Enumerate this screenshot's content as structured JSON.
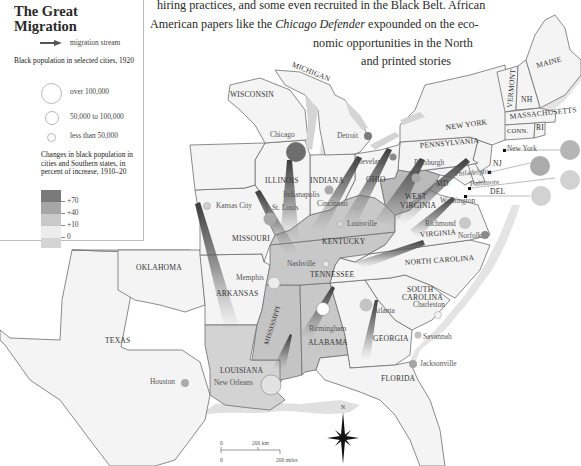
{
  "prose": {
    "line1": "hiring practices, and some even recruited in the Black Belt. African",
    "line2_pre": "American papers like the ",
    "line2_italic": "Chicago Defender",
    "line2_post": " expounded on the eco-",
    "line3": "nomic  opportunities  in  the  North",
    "line4": "and  printed  stories"
  },
  "legend": {
    "title_line1": "The Great",
    "title_line2": "Migration",
    "stream_label": "migration stream",
    "population_heading": "Black population in selected cities, 1920",
    "sizes": [
      {
        "label": "over 100,000"
      },
      {
        "label": "50,000 to 100,000"
      },
      {
        "label": "less than 50,000"
      }
    ],
    "change_heading": "Changes in black population in cities and Southern states, in percent of increase, 1910–20",
    "scale": [
      {
        "label": "+70",
        "color": "#7a7a7a"
      },
      {
        "label": "+40",
        "color": "#a6a6a6"
      },
      {
        "label": "+10",
        "color": "#c9c9c9"
      },
      {
        "label": "0",
        "color": "#ececec"
      },
      {
        "label": "",
        "color": "#d4d4d4"
      }
    ]
  },
  "states": {
    "wisconsin": "WISCONSIN",
    "michigan": "MICHIGAN",
    "illinois": "ILLINOIS",
    "indiana": "INDIANA",
    "ohio": "OHIO",
    "pennsylvania": "PENNSYLVANIA",
    "new_york": "NEW YORK",
    "vermont": "VERMONT",
    "nh": "NH",
    "maine": "MAINE",
    "massachusetts": "MASSACHUSETTS",
    "conn": "CONN.",
    "ri": "RI",
    "nj": "NJ",
    "md": "MD",
    "del": "DEL",
    "west_virginia_1": "WEST",
    "west_virginia_2": "VIRGINIA",
    "virginia": "VIRGINIA",
    "kentucky": "KENTUCKY",
    "tennessee": "TENNESSEE",
    "north_carolina": "NORTH CAROLINA",
    "south_carolina_1": "SOUTH",
    "south_carolina_2": "CAROLINA",
    "georgia": "GEORGIA",
    "alabama": "ALABAMA",
    "mississippi": "MISSISSIPPI",
    "louisiana": "LOUISIANA",
    "arkansas": "ARKANSAS",
    "missouri": "MISSOURI",
    "oklahoma": "OKLAHOMA",
    "texas": "TEXAS",
    "florida": "FLORIDA"
  },
  "cities": {
    "chicago": "Chicago",
    "detroit": "Detroit",
    "cleveland": "Cleveland",
    "pittsburgh": "Pittsburgh",
    "new_york": "New York",
    "philadelphia": "Philadelphia",
    "baltimore": "Baltimore",
    "washington": "Washington",
    "indianapolis": "Indianapolis",
    "cincinnati": "Cincinnati",
    "st_louis": "St. Louis",
    "kansas_city": "Kansas City",
    "louisville": "Louisville",
    "richmond": "Richmond",
    "norfolk": "Norfolk",
    "nashville": "Nashville",
    "memphis": "Memphis",
    "birmingham": "Birmingham",
    "atlanta": "Atlanta",
    "charleston": "Charleston",
    "savannah": "Savannah",
    "jacksonville": "Jacksonville",
    "new_orleans": "New Orleans",
    "houston": "Houston"
  },
  "scale_bar": {
    "km_zero": "0",
    "km_label": "200 km",
    "mi_zero": "0",
    "mi_label": "200 miles"
  },
  "compass": {
    "north": "N"
  },
  "colors": {
    "map_bg": "#ffffff",
    "water": "#d6d6d6",
    "state_light": "#f3f3f3",
    "state_mid": "#d2d2d2",
    "state_dark": "#bdbdbd",
    "city_dark": "#6e6e6e",
    "city_mid": "#a9a9a9",
    "city_light": "#c8c8c8",
    "border": "#7a7a7a"
  }
}
